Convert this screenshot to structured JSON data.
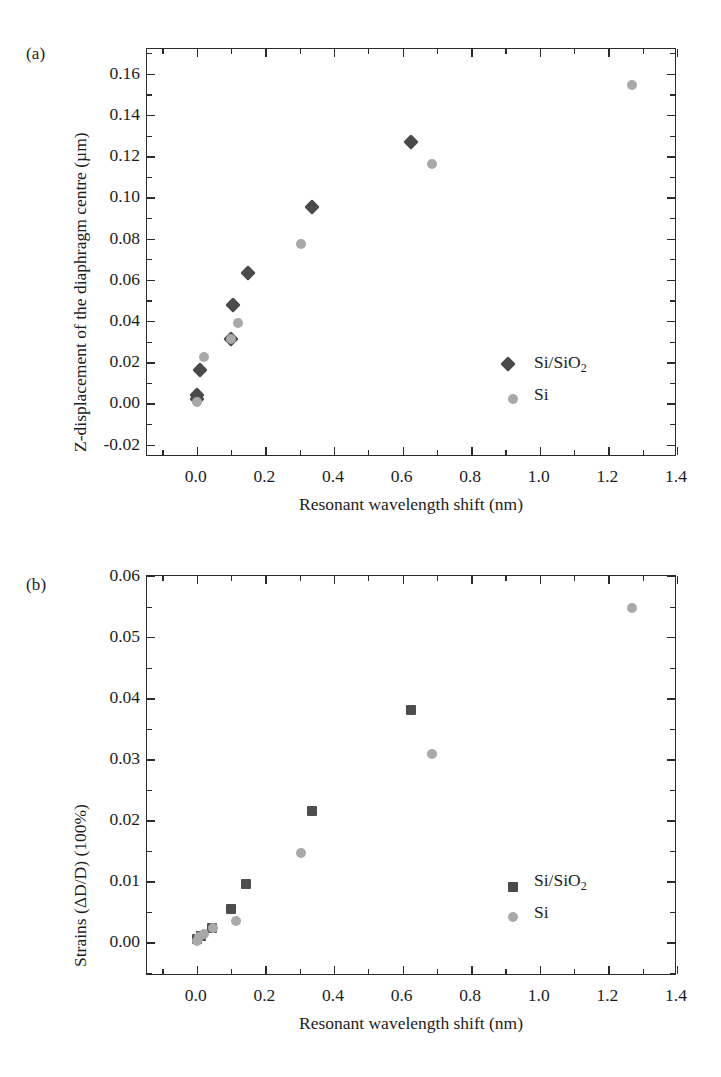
{
  "figure": {
    "panels": [
      {
        "id": "a",
        "label": "(a)",
        "xlabel": "Resonant wavelength shift (nm)",
        "ylabel_prefix": "Z-displacement of the diaphragm centre (µm)",
        "xticks": [
          "0.0",
          "0.2",
          "0.4",
          "0.6",
          "0.8",
          "1.0",
          "1.2",
          "1.4"
        ],
        "yticks": [
          "-0.02",
          "0.00",
          "0.02",
          "0.04",
          "0.06",
          "0.08",
          "0.10",
          "0.12",
          "0.14",
          "0.16"
        ],
        "legend": [
          {
            "label_main": "Si/SiO",
            "label_sub": "2",
            "marker": "diamond-marker"
          },
          {
            "label_main": "Si",
            "label_sub": "",
            "marker": "circle-marker"
          }
        ]
      },
      {
        "id": "b",
        "label": "(b)",
        "xlabel": "Resonant wavelength shift (nm)",
        "ylabel_prefix": "Strains (ΔD/D) (100%)",
        "xticks": [
          "0.0",
          "0.2",
          "0.4",
          "0.6",
          "0.8",
          "1.0",
          "1.2",
          "1.4"
        ],
        "yticks": [
          "0.00",
          "0.01",
          "0.02",
          "0.03",
          "0.04",
          "0.05",
          "0.06"
        ],
        "legend": [
          {
            "label_main": "Si/SiO",
            "label_sub": "2",
            "marker": "square-marker"
          },
          {
            "label_main": "Si",
            "label_sub": "",
            "marker": "circle-marker"
          }
        ]
      }
    ]
  },
  "colors": {
    "dark_marker": "#4a4a4a",
    "light_marker": "#a9a9a9",
    "axis": "#2b2b2b",
    "text": "#1c1c1c",
    "background": "#ffffff"
  },
  "chart_data": [
    {
      "type": "scatter",
      "panel": "(a)",
      "title": "",
      "xlabel": "Resonant wavelength shift (nm)",
      "ylabel": "Z-displacement of the diaphragm centre (µm)",
      "xlim": [
        -0.145,
        1.4
      ],
      "ylim": [
        -0.026,
        0.172
      ],
      "xticks": [
        0.0,
        0.2,
        0.4,
        0.6,
        0.8,
        1.0,
        1.2,
        1.4
      ],
      "yticks": [
        -0.02,
        0.0,
        0.02,
        0.04,
        0.06,
        0.08,
        0.1,
        0.12,
        0.14,
        0.16
      ],
      "minor_ticks": true,
      "grid": false,
      "legend_position": "lower-right",
      "series": [
        {
          "name": "Si/SiO2",
          "marker": "diamond",
          "color": "#4a4a4a",
          "points": [
            {
              "x": 0.0,
              "y": 0.004
            },
            {
              "x": 0.0,
              "y": 0.002
            },
            {
              "x": 0.01,
              "y": 0.016
            },
            {
              "x": 0.1,
              "y": 0.0315
            },
            {
              "x": 0.105,
              "y": 0.048
            },
            {
              "x": 0.15,
              "y": 0.0635
            },
            {
              "x": 0.335,
              "y": 0.0955
            },
            {
              "x": 0.625,
              "y": 0.127
            }
          ]
        },
        {
          "name": "Si",
          "marker": "circle",
          "color": "#a9a9a9",
          "points": [
            {
              "x": 0.0,
              "y": 0.0005
            },
            {
              "x": 0.02,
              "y": 0.0225
            },
            {
              "x": 0.1,
              "y": 0.0315
            },
            {
              "x": 0.12,
              "y": 0.039
            },
            {
              "x": 0.305,
              "y": 0.0775
            },
            {
              "x": 0.685,
              "y": 0.116
            },
            {
              "x": 1.27,
              "y": 0.1545
            }
          ]
        }
      ]
    },
    {
      "type": "scatter",
      "panel": "(b)",
      "title": "",
      "xlabel": "Resonant wavelength shift (nm)",
      "ylabel": "Strains (ΔD/D) (100%)",
      "xlim": [
        -0.145,
        1.4
      ],
      "ylim": [
        -0.0055,
        0.06
      ],
      "xticks": [
        0.0,
        0.2,
        0.4,
        0.6,
        0.8,
        1.0,
        1.2,
        1.4
      ],
      "yticks": [
        0.0,
        0.01,
        0.02,
        0.03,
        0.04,
        0.05,
        0.06
      ],
      "minor_ticks": true,
      "grid": false,
      "legend_position": "lower-right",
      "series": [
        {
          "name": "Si/SiO2",
          "marker": "square",
          "color": "#4d4d4d",
          "points": [
            {
              "x": 0.0,
              "y": 0.0006
            },
            {
              "x": 0.012,
              "y": 0.0011
            },
            {
              "x": 0.045,
              "y": 0.0024
            },
            {
              "x": 0.1,
              "y": 0.0055
            },
            {
              "x": 0.145,
              "y": 0.0096
            },
            {
              "x": 0.335,
              "y": 0.0215
            },
            {
              "x": 0.625,
              "y": 0.038
            }
          ]
        },
        {
          "name": "Si",
          "marker": "circle",
          "color": "#a9a9a9",
          "points": [
            {
              "x": 0.0,
              "y": 0.0003
            },
            {
              "x": 0.008,
              "y": 0.0009
            },
            {
              "x": 0.02,
              "y": 0.0014
            },
            {
              "x": 0.048,
              "y": 0.0024
            },
            {
              "x": 0.115,
              "y": 0.0035
            },
            {
              "x": 0.305,
              "y": 0.0147
            },
            {
              "x": 0.685,
              "y": 0.0308
            },
            {
              "x": 1.27,
              "y": 0.0547
            }
          ]
        }
      ]
    }
  ]
}
